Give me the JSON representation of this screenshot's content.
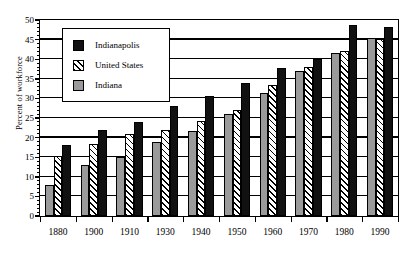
{
  "chart_data": {
    "type": "bar",
    "title": "",
    "subtitle": "",
    "xlabel": "",
    "ylabel": "Percent of workforce",
    "ylim": [
      0,
      50
    ],
    "ytick_step": 5,
    "yminor_step": 1,
    "grid": "horizontal",
    "legend_position": "upper-left-inside",
    "categories": [
      "1880",
      "1900",
      "1910",
      "1930",
      "1940",
      "1950",
      "1960",
      "1970",
      "1980",
      "1990"
    ],
    "series": [
      {
        "name": "Indiana",
        "color": "#9a9a9a",
        "pattern": "solid-gray",
        "values": [
          8.0,
          13.0,
          15.0,
          19.0,
          21.7,
          26.0,
          31.4,
          37.1,
          41.7,
          45.5
        ]
      },
      {
        "name": "United States",
        "color": "#ffffff",
        "pattern": "diagonal-hatch",
        "values": [
          15.2,
          18.3,
          21.0,
          22.0,
          24.2,
          27.0,
          33.3,
          37.9,
          42.1,
          45.2
        ]
      },
      {
        "name": "Indianapolis",
        "color": "#111111",
        "pattern": "solid-black",
        "values": [
          18.0,
          22.0,
          24.0,
          28.0,
          30.7,
          34.0,
          37.8,
          40.0,
          48.8,
          48.2
        ]
      }
    ],
    "ytick_labels": [
      "0",
      "5",
      "10",
      "15",
      "20",
      "25",
      "30",
      "35",
      "40",
      "45",
      "50"
    ]
  },
  "legend": {
    "entries": [
      {
        "label": "Indianapolis",
        "series": "Indianapolis"
      },
      {
        "label": "United States",
        "series": "United States"
      },
      {
        "label": "Indiana",
        "series": "Indiana"
      }
    ]
  },
  "axes": {
    "y_title": "Percent of workforce"
  }
}
